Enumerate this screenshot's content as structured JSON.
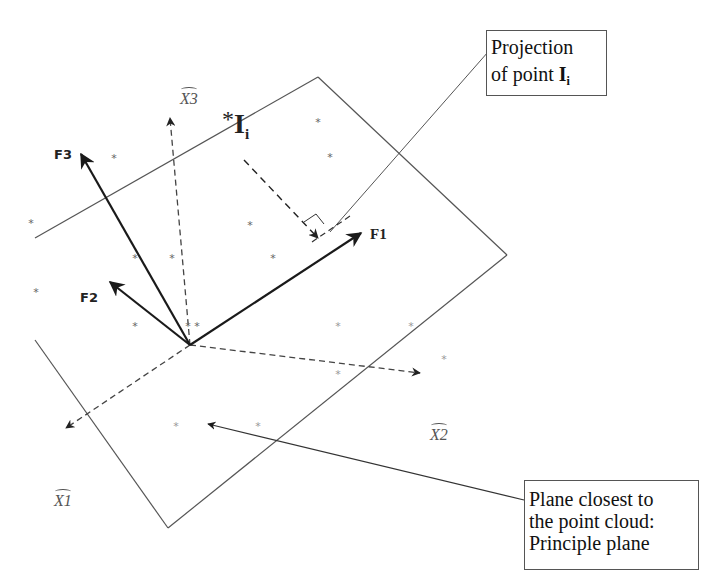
{
  "diagram": {
    "axes": {
      "original": [
        {
          "id": "X1",
          "label": "X1",
          "style": "dashed",
          "hat": true
        },
        {
          "id": "X2",
          "label": "X2",
          "style": "dashed",
          "hat": true
        },
        {
          "id": "X3",
          "label": "X3",
          "style": "dashed",
          "hat": true
        }
      ],
      "factors": [
        {
          "id": "F1",
          "label": "F1",
          "style": "solid"
        },
        {
          "id": "F2",
          "label": "F2",
          "style": "solid"
        },
        {
          "id": "F3",
          "label": "F3",
          "style": "solid"
        }
      ]
    },
    "point": {
      "marker": "*",
      "label_main": "I",
      "label_sub": "i"
    },
    "callouts": {
      "projection": {
        "line1": "Projection",
        "line2_prefix": "of point ",
        "line2_bold": "I",
        "line2_sub": "i"
      },
      "plane": {
        "line1": "Plane closest to",
        "line2": "the point cloud:",
        "line3": "Principle plane"
      }
    },
    "point_cloud_marker": "*",
    "colors": {
      "background": "#ffffff",
      "plane_edge": "#555555",
      "arrow": "#1a1a1a",
      "dashed_axis": "#444444",
      "points": "#777777",
      "text": "#111111"
    }
  }
}
